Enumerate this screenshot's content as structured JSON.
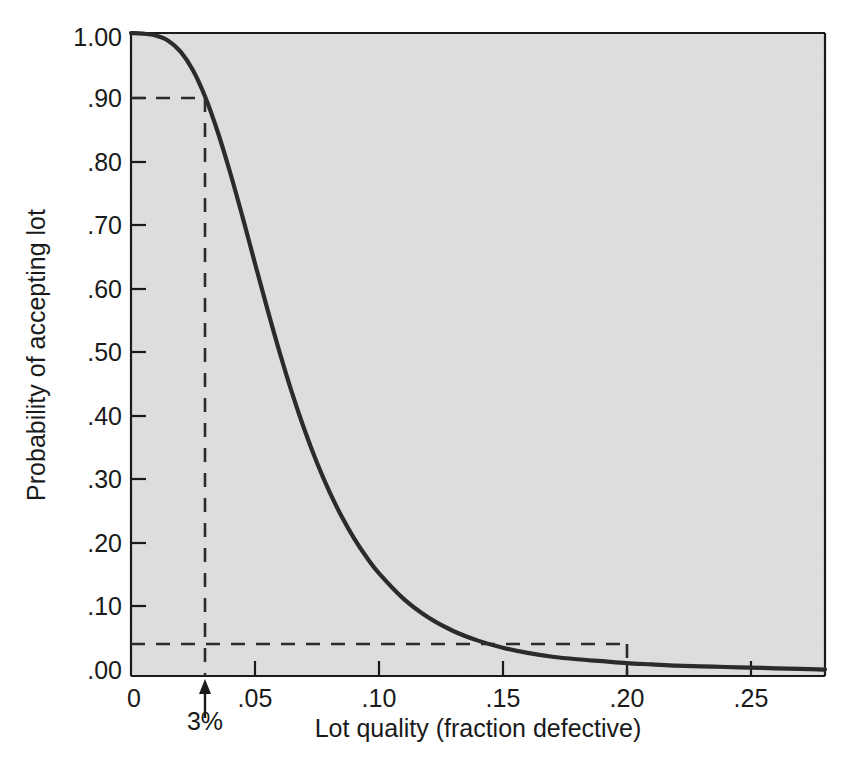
{
  "chart_data": {
    "type": "line",
    "title": "",
    "subtitle": "",
    "xlabel": "Lot quality (fraction defective)",
    "ylabel": "Probability of accepting lot",
    "xlim": [
      0,
      0.28
    ],
    "ylim": [
      0.0,
      1.0
    ],
    "grid": false,
    "legend": null,
    "plot_background_color": "#cdcdcd",
    "curve_color": "#2b2b2b",
    "axis_color": "#1a1a1a",
    "xticks": [
      {
        "value": 0,
        "label": "0"
      },
      {
        "value": 0.05,
        "label": ".05"
      },
      {
        "value": 0.1,
        "label": ".10"
      },
      {
        "value": 0.15,
        "label": ".15"
      },
      {
        "value": 0.2,
        "label": ".20"
      },
      {
        "value": 0.25,
        "label": ".25"
      }
    ],
    "yticks": [
      {
        "value": 0.0,
        "label": ".00"
      },
      {
        "value": 0.1,
        "label": ".10"
      },
      {
        "value": 0.2,
        "label": ".20"
      },
      {
        "value": 0.3,
        "label": ".30"
      },
      {
        "value": 0.4,
        "label": ".40"
      },
      {
        "value": 0.5,
        "label": ".50"
      },
      {
        "value": 0.6,
        "label": ".60"
      },
      {
        "value": 0.7,
        "label": ".70"
      },
      {
        "value": 0.8,
        "label": ".80"
      },
      {
        "value": 0.9,
        "label": ".90"
      },
      {
        "value": 1.0,
        "label": "1.00"
      }
    ],
    "series": [
      {
        "name": "Operating characteristic curve",
        "x": [
          0.0,
          0.005,
          0.01,
          0.015,
          0.02,
          0.025,
          0.03,
          0.035,
          0.04,
          0.045,
          0.05,
          0.055,
          0.06,
          0.065,
          0.07,
          0.075,
          0.08,
          0.085,
          0.09,
          0.095,
          0.1,
          0.11,
          0.12,
          0.13,
          0.14,
          0.15,
          0.16,
          0.17,
          0.18,
          0.19,
          0.2,
          0.21,
          0.22,
          0.23,
          0.24,
          0.25,
          0.26,
          0.27,
          0.28
        ],
        "y": [
          1.0,
          0.999,
          0.996,
          0.988,
          0.971,
          0.942,
          0.9,
          0.846,
          0.783,
          0.714,
          0.642,
          0.571,
          0.503,
          0.44,
          0.383,
          0.332,
          0.287,
          0.248,
          0.214,
          0.185,
          0.16,
          0.12,
          0.091,
          0.07,
          0.055,
          0.044,
          0.036,
          0.03,
          0.026,
          0.023,
          0.02,
          0.018,
          0.016,
          0.015,
          0.014,
          0.013,
          0.012,
          0.011,
          0.01
        ]
      }
    ],
    "annotations": [
      {
        "name": "aql-reference",
        "label": "3%",
        "x": 0.03,
        "y": 0.9,
        "style": "dashed-guide-with-arrow",
        "description": "Dashed guide from probability .90 down to lot quality .03, marked 3%"
      },
      {
        "name": "ltpd-reference",
        "label": "",
        "x": 0.2,
        "y": 0.05,
        "style": "dashed-guide",
        "description": "Dashed guide from probability .05 across to lot quality .20"
      }
    ],
    "guides": {
      "horizontal": [
        0.9,
        0.05
      ],
      "vertical": [
        0.03,
        0.2
      ]
    }
  }
}
